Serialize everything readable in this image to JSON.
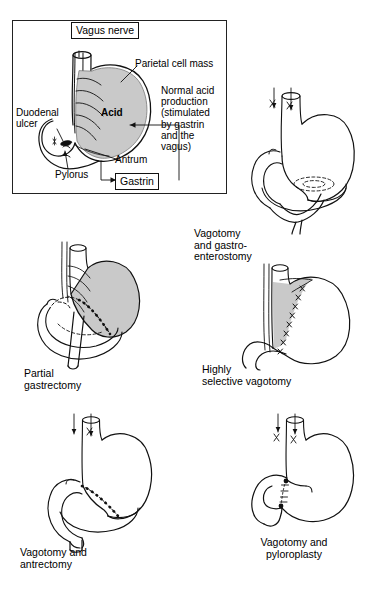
{
  "figure": {
    "title_present": false,
    "background_color": "#ffffff",
    "ink_color": "#000000",
    "acid_fill_color": "#c9c9c9",
    "panel_count": 5
  },
  "top_panel": {
    "name": "normal-acid-production",
    "boxed_labels": [
      {
        "id": "vagus-nerve",
        "text": "Vagus nerve"
      },
      {
        "id": "gastrin",
        "text": "Gastrin"
      }
    ],
    "labels": [
      {
        "id": "parietal-cell-mass",
        "text": "Parietal cell mass"
      },
      {
        "id": "duodenal-ulcer",
        "text": "Duodenal\nulcer"
      },
      {
        "id": "acid",
        "text": "Acid"
      },
      {
        "id": "pylorus",
        "text": "Pylorus"
      },
      {
        "id": "antrum",
        "text": "Antrum"
      }
    ],
    "description": "Normal acid\nproduction\n(stimulated\nby gastrin\nand the\nvagus)"
  },
  "procedures": [
    {
      "id": "vagotomy-and-gastroenterostomy",
      "caption": "Vagotomy\nand gastro-\nenterostomy",
      "features": [
        "cut vagus nerve trunks",
        "gastroenterostomy stoma",
        "jejunal loop"
      ]
    },
    {
      "id": "partial-gastrectomy",
      "caption": "Partial\ngastrectomy",
      "features": [
        "resected antrum",
        "suture line",
        "shaded parietal cell mass retained"
      ]
    },
    {
      "id": "highly-selective-vagotomy",
      "caption": "Highly\nselective vagotomy",
      "features": [
        "divided nerve branches to parietal cell mass",
        "antral innervation preserved"
      ]
    },
    {
      "id": "vagotomy-and-antrectomy",
      "caption": "Vagotomy and\nantrectomy",
      "features": [
        "cut vagus nerve trunks",
        "antrum removed",
        "anastomosis suture line"
      ]
    },
    {
      "id": "vagotomy-and-pyloroplasty",
      "caption": "Vagotomy and\npyloroplasty",
      "features": [
        "cut vagus nerve trunks",
        "pyloroplasty suture line"
      ]
    }
  ],
  "symbols": {
    "cut_nerve_mark": "X",
    "suture_mark": "x-stitches",
    "hidden_edge": "dashed outline"
  }
}
